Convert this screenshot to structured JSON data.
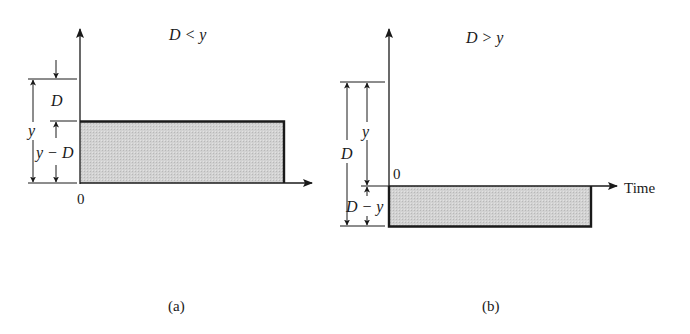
{
  "figure": {
    "panels": [
      {
        "id": "a",
        "caption": "(a)",
        "title": "D < y",
        "origin_label": "0",
        "dimension_labels": {
          "outer": "y",
          "upper": "D",
          "lower": "y − D"
        },
        "shaded_region": "above time axis, height y − D"
      },
      {
        "id": "b",
        "caption": "(b)",
        "title": "D > y",
        "origin_label": "0",
        "x_axis_label": "Time",
        "dimension_labels": {
          "outer": "D",
          "upper": "y",
          "lower": "D − y"
        },
        "shaded_region": "below time axis, depth D − y"
      }
    ],
    "colors": {
      "line": "#1a1a1a",
      "fill": "#cfcfcf"
    }
  }
}
